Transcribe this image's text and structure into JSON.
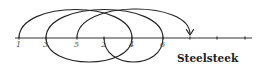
{
  "diagram": {
    "title": "Steelsteek",
    "baseline": {
      "x1": 15,
      "x2": 252,
      "y": 38
    },
    "points": [
      {
        "label": "1",
        "x": 19
      },
      {
        "label": "3",
        "x": 46
      },
      {
        "label": "5",
        "x": 77
      },
      {
        "label": "2",
        "x": 104
      },
      {
        "label": "4",
        "x": 132
      },
      {
        "label": "6",
        "x": 163
      }
    ],
    "extra_ticks": [
      190,
      217,
      245
    ],
    "top_arcs": [
      {
        "from": 19,
        "to": 132
      },
      {
        "from": 46,
        "to": 163
      },
      {
        "from": 77,
        "to": 190,
        "arrow": true
      }
    ],
    "bottom_arcs": [
      {
        "from": 46,
        "to": 132
      },
      {
        "from": 104,
        "to": 163
      }
    ],
    "colors": {
      "stroke": "#222222",
      "label": "#555555"
    }
  }
}
